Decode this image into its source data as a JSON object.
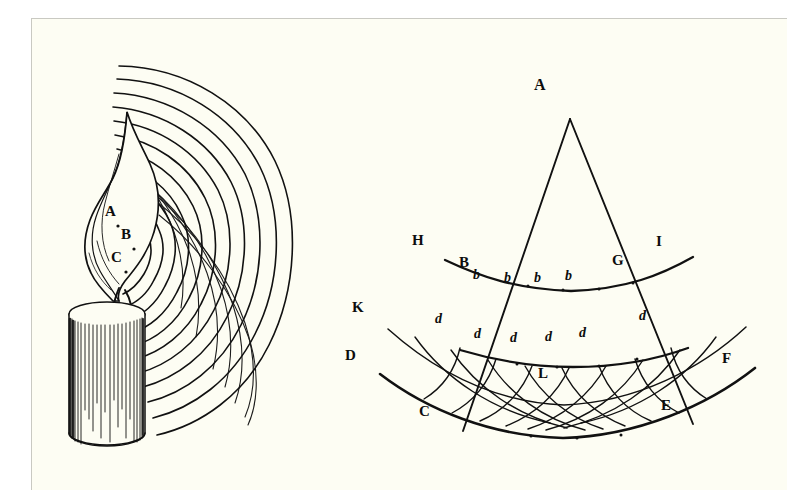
{
  "page": {
    "background_color": "#fdfdf3",
    "ink_color": "#111111",
    "border_color": "#c9c9c2",
    "width": 787,
    "height": 500
  },
  "figure_left": {
    "name": "candle-radiating-waves",
    "description": "Engraving of a burning candle emitting concentric circular waves to the right",
    "labels": [
      {
        "text": "A",
        "x": 104,
        "y": 203,
        "size": 15,
        "italic": false
      },
      {
        "text": "B",
        "x": 120,
        "y": 226,
        "size": 15,
        "italic": false
      },
      {
        "text": "C",
        "x": 110,
        "y": 249,
        "size": 15,
        "italic": false
      }
    ],
    "wave_count": 11,
    "wave_origin": {
      "x": 120,
      "y": 245
    }
  },
  "figure_right": {
    "name": "huygens-wavefront-construction",
    "description": "Geometric diagram: cone from apex A cut by three arcs BG, dd and CE with secondary wavelets",
    "labels": [
      {
        "text": "A",
        "x": 534,
        "y": 78,
        "size": 16,
        "italic": false
      },
      {
        "text": "H",
        "x": 412,
        "y": 233,
        "size": 15,
        "italic": false
      },
      {
        "text": "I",
        "x": 654,
        "y": 234,
        "size": 15,
        "italic": false
      },
      {
        "text": "B",
        "x": 458,
        "y": 255,
        "size": 15,
        "italic": false
      },
      {
        "text": "G",
        "x": 611,
        "y": 253,
        "size": 15,
        "italic": false
      },
      {
        "text": "K",
        "x": 351,
        "y": 300,
        "size": 15,
        "italic": false
      },
      {
        "text": "D",
        "x": 344,
        "y": 348,
        "size": 15,
        "italic": false
      },
      {
        "text": "F",
        "x": 721,
        "y": 351,
        "size": 15,
        "italic": false
      },
      {
        "text": "L",
        "x": 537,
        "y": 366,
        "size": 15,
        "italic": false
      },
      {
        "text": "C",
        "x": 418,
        "y": 404,
        "size": 15,
        "italic": false
      },
      {
        "text": "E",
        "x": 660,
        "y": 398,
        "size": 15,
        "italic": false
      },
      {
        "text": "b",
        "x": 472,
        "y": 268,
        "size": 13,
        "italic": true
      },
      {
        "text": "b",
        "x": 503,
        "y": 271,
        "size": 13,
        "italic": true
      },
      {
        "text": "b",
        "x": 533,
        "y": 271,
        "size": 13,
        "italic": true
      },
      {
        "text": "b",
        "x": 564,
        "y": 269,
        "size": 13,
        "italic": true
      },
      {
        "text": "d",
        "x": 434,
        "y": 312,
        "size": 13,
        "italic": true
      },
      {
        "text": "d",
        "x": 473,
        "y": 327,
        "size": 13,
        "italic": true
      },
      {
        "text": "d",
        "x": 509,
        "y": 331,
        "size": 13,
        "italic": true
      },
      {
        "text": "d",
        "x": 544,
        "y": 330,
        "size": 13,
        "italic": true
      },
      {
        "text": "d",
        "x": 578,
        "y": 326,
        "size": 13,
        "italic": true
      },
      {
        "text": "d",
        "x": 638,
        "y": 309,
        "size": 13,
        "italic": true
      }
    ],
    "apex": {
      "x": 538,
      "y": 100
    },
    "arc_primary": {
      "from": "B",
      "to": "G"
    },
    "arc_secondary": {
      "from": "d",
      "to": "d"
    },
    "arc_base": {
      "from": "C",
      "to": "E"
    },
    "ray_left_end": {
      "x": 431,
      "y": 412
    },
    "ray_right_end": {
      "x": 661,
      "y": 405
    }
  }
}
